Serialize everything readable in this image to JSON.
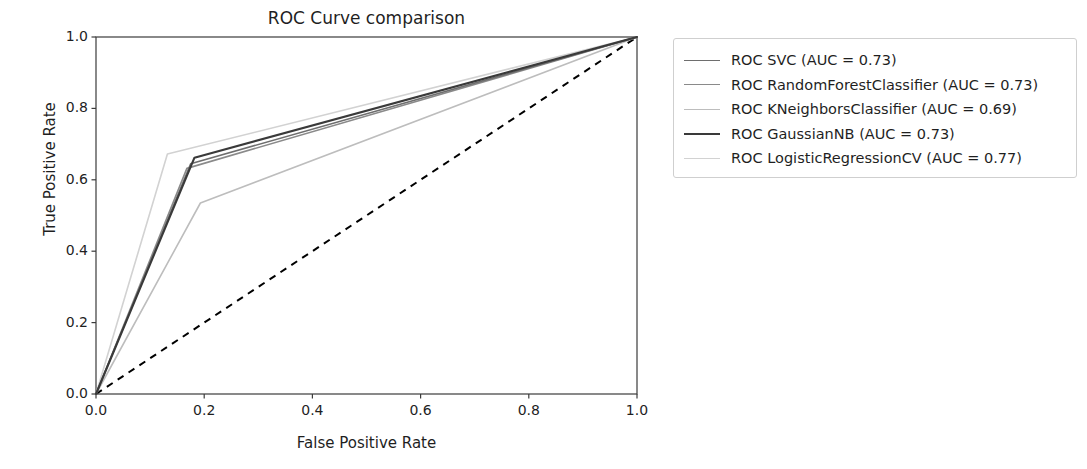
{
  "chart_data": {
    "type": "line",
    "title": "ROC Curve comparison",
    "xlabel": "False Positive Rate",
    "ylabel": "True Positive Rate",
    "xlim": [
      0.0,
      1.0
    ],
    "ylim": [
      0.0,
      1.0
    ],
    "xticks": [
      "0.0",
      "0.2",
      "0.4",
      "0.6",
      "0.8",
      "1.0"
    ],
    "yticks": [
      "0.0",
      "0.2",
      "0.4",
      "0.6",
      "0.8",
      "1.0"
    ],
    "xtick_values": [
      0.0,
      0.2,
      0.4,
      0.6,
      0.8,
      1.0
    ],
    "ytick_values": [
      0.0,
      0.2,
      0.4,
      0.6,
      0.8,
      1.0
    ],
    "grid": false,
    "legend_position": "outside right upper",
    "series": [
      {
        "name": "ROC SVC (AUC = 0.73)",
        "model": "SVC",
        "auc": 0.73,
        "color": "#6e6e6e",
        "linewidth": 1.6,
        "x": [
          0.0,
          0.175,
          1.0
        ],
        "y": [
          0.0,
          0.645,
          1.0
        ]
      },
      {
        "name": "ROC RandomForestClassifier (AUC = 0.73)",
        "model": "RandomForestClassifier",
        "auc": 0.73,
        "color": "#8a8a8a",
        "linewidth": 1.6,
        "x": [
          0.0,
          0.168,
          1.0
        ],
        "y": [
          0.0,
          0.632,
          1.0
        ]
      },
      {
        "name": "ROC KNeighborsClassifier (AUC = 0.69)",
        "model": "KNeighborsClassifier",
        "auc": 0.69,
        "color": "#bdbdbd",
        "linewidth": 1.6,
        "x": [
          0.0,
          0.193,
          1.0
        ],
        "y": [
          0.0,
          0.535,
          1.0
        ]
      },
      {
        "name": "ROC GaussianNB (AUC = 0.73)",
        "model": "GaussianNB",
        "auc": 0.73,
        "color": "#3a3a3a",
        "linewidth": 2.1,
        "x": [
          0.0,
          0.182,
          1.0
        ],
        "y": [
          0.0,
          0.662,
          1.0
        ]
      },
      {
        "name": "ROC LogisticRegressionCV (AUC = 0.77)",
        "model": "LogisticRegressionCV",
        "auc": 0.77,
        "color": "#d2d2d2",
        "linewidth": 1.6,
        "x": [
          0.0,
          0.132,
          1.0
        ],
        "y": [
          0.0,
          0.672,
          1.0
        ]
      }
    ],
    "baseline": {
      "name": "chance-diagonal",
      "color": "#000000",
      "linestyle": "dashed",
      "x": [
        0.0,
        1.0
      ],
      "y": [
        0.0,
        1.0
      ]
    }
  }
}
